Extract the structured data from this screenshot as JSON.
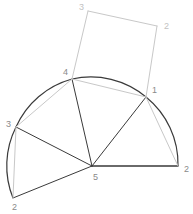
{
  "figure": {
    "canvas": {
      "width": 193,
      "height": 214,
      "background": "#ffffff"
    },
    "colors": {
      "dark_stroke": "#3a3a3a",
      "mid_stroke": "#555555",
      "light_stroke": "#c8c8c8",
      "label_dark": "#8a8a8a",
      "label_light": "#c2c2c2"
    },
    "points": {
      "p1": {
        "label": "1",
        "x": 146,
        "y": 97,
        "label_x": 152,
        "label_y": 91,
        "tone": "dark"
      },
      "p2_right": {
        "label": "2",
        "x": 178,
        "y": 166,
        "label_x": 184,
        "label_y": 170,
        "tone": "dark"
      },
      "p3_left": {
        "label": "3",
        "x": 16,
        "y": 127,
        "label_x": 6,
        "label_y": 125,
        "tone": "dark"
      },
      "p2_bot": {
        "label": "2",
        "x": 13,
        "y": 198,
        "label_x": 12,
        "label_y": 208,
        "tone": "dark"
      },
      "p4": {
        "label": "4",
        "x": 72,
        "y": 79,
        "label_x": 63,
        "label_y": 73,
        "tone": "dark"
      },
      "p5": {
        "label": "5",
        "x": 92,
        "y": 166,
        "label_x": 93,
        "label_y": 178,
        "tone": "dark"
      },
      "q3": {
        "label": "3",
        "x": 88,
        "y": 11,
        "label_x": 79,
        "label_y": 8,
        "tone": "light"
      },
      "q2": {
        "label": "2",
        "x": 157,
        "y": 26,
        "label_x": 164,
        "label_y": 27,
        "tone": "light"
      }
    },
    "edges": [
      {
        "name": "edge-5-to-2right",
        "from": "p5",
        "to": "p2_right",
        "tone": "dark",
        "width": 1.6
      },
      {
        "name": "edge-5-to-1",
        "from": "p5",
        "to": "p1",
        "tone": "dark",
        "width": 1.0
      },
      {
        "name": "edge-5-to-4",
        "from": "p5",
        "to": "p4",
        "tone": "dark",
        "width": 1.0
      },
      {
        "name": "edge-5-to-3",
        "from": "p5",
        "to": "p3_left",
        "tone": "dark",
        "width": 1.0
      },
      {
        "name": "edge-5-to-2bot",
        "from": "p5",
        "to": "p2_bot",
        "tone": "dark",
        "width": 1.0
      },
      {
        "name": "edge-3-to-2bot",
        "from": "p3_left",
        "to": "p2_bot",
        "tone": "light",
        "width": 1.0
      },
      {
        "name": "edge-3-to-4",
        "from": "p3_left",
        "to": "p4",
        "tone": "light",
        "width": 1.0
      },
      {
        "name": "edge-4-to-1",
        "from": "p4",
        "to": "p1",
        "tone": "light",
        "width": 1.0
      },
      {
        "name": "edge-1-to-2right",
        "from": "p1",
        "to": "p2_right",
        "tone": "light",
        "width": 1.0
      },
      {
        "name": "edge-quad-4-to-3",
        "from": "p4",
        "to": "q3",
        "tone": "light",
        "width": 1.0
      },
      {
        "name": "edge-quad-3-to-2",
        "from": "q3",
        "to": "q2",
        "tone": "light",
        "width": 1.0
      },
      {
        "name": "edge-quad-2-to-1",
        "from": "q2",
        "to": "p1",
        "tone": "light",
        "width": 1.0
      }
    ],
    "arcs": [
      {
        "name": "arc-3-to-4",
        "from": "p3_left",
        "to": "p4",
        "sweep": 1,
        "tone": "dark",
        "width": 1.2
      },
      {
        "name": "arc-4-to-1",
        "from": "p4",
        "to": "p1",
        "sweep": 1,
        "tone": "dark",
        "width": 1.2
      },
      {
        "name": "arc-1-to-2",
        "from": "p1",
        "to": "p2_right",
        "sweep": 1,
        "tone": "dark",
        "width": 1.2
      },
      {
        "name": "arc-2-to-3",
        "from": "p2_bot",
        "to": "p3_left",
        "sweep": 1,
        "tone": "dark",
        "width": 1.2
      }
    ],
    "circle": {
      "center_x": 92,
      "center_y": 166,
      "radius": 86
    }
  }
}
